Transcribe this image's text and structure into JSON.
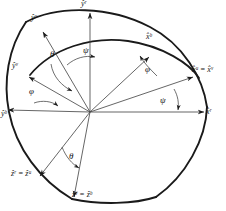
{
  "figure": {
    "type": "vector-frame-diagram",
    "origin": {
      "x": 90,
      "y": 112
    },
    "background_color": "#ffffff",
    "line_color": "#1a1a1a"
  },
  "axis_labels": [
    {
      "id": "y-r",
      "text": "ŷʳ",
      "base": "y",
      "sup": "r",
      "x": 82,
      "y": 1,
      "anchor": "top-center"
    },
    {
      "id": "y-u",
      "text": "ŷᵘ",
      "base": "y",
      "sup": "u",
      "x": 33,
      "y": 15,
      "anchor": "upper-left"
    },
    {
      "id": "y-v",
      "text": "ŷᵛ",
      "base": "y",
      "sup": "v",
      "x": 13,
      "y": 63,
      "anchor": "left"
    },
    {
      "id": "y-b",
      "text": "ŷᵇ",
      "base": "y",
      "sup": "b",
      "x": 2,
      "y": 110,
      "anchor": "lower-left"
    },
    {
      "id": "x-b",
      "text": "x̂ᵇ",
      "base": "x",
      "sup": "b",
      "x": 147,
      "y": 35,
      "anchor": "inner-arc"
    },
    {
      "id": "x-uv",
      "text": "x̂ᵘ = x̂ᵛ",
      "base": "x",
      "sup": "u = v",
      "x": 193,
      "y": 68,
      "anchor": "right"
    },
    {
      "id": "x-r",
      "text": "x̂ʳ",
      "base": "x",
      "sup": "r",
      "x": 205,
      "y": 110,
      "anchor": "far-right"
    },
    {
      "id": "z-ru",
      "text": "ẑʳ = ẑᵘ",
      "base": "z",
      "sup": "r = u",
      "x": 12,
      "y": 172,
      "anchor": "bottom-left"
    },
    {
      "id": "z-vb",
      "text": "ẑᵛ = ẑᵇ",
      "base": "z",
      "sup": "v = b",
      "x": 73,
      "y": 192,
      "anchor": "bottom-center"
    }
  ],
  "angle_labels": [
    {
      "id": "theta-upper",
      "text": "θ",
      "x": 51,
      "y": 54
    },
    {
      "id": "psi-upper",
      "text": "ψ",
      "x": 84,
      "y": 50
    },
    {
      "id": "phi-left",
      "text": "φ",
      "x": 30,
      "y": 91
    },
    {
      "id": "phi-right",
      "text": "φ",
      "x": 146,
      "y": 69
    },
    {
      "id": "psi-right",
      "text": "ψ",
      "x": 161,
      "y": 99
    },
    {
      "id": "theta-lower",
      "text": "θ",
      "x": 70,
      "y": 156
    }
  ],
  "arcs": [
    {
      "id": "outer-great-circle",
      "note": "outer ellipse arc from ŷᵘ region through ŷʳ to x̂ʳ and down to ẑᵛ"
    },
    {
      "id": "inner-great-circle",
      "note": "inner arc through x̂ᵇ from ŷᵛ to x̂ᵘ = x̂ᵛ"
    }
  ],
  "vectors": [
    {
      "id": "vec-x-r",
      "target": "x̂ʳ",
      "angle_deg": 0
    },
    {
      "id": "vec-x-uv",
      "target": "x̂ᵘ = x̂ᵛ",
      "angle_deg": 24
    },
    {
      "id": "vec-x-b",
      "target": "x̂ᵇ",
      "angle_deg": 47
    },
    {
      "id": "vec-y-r",
      "target": "ŷʳ",
      "angle_deg": 90
    },
    {
      "id": "vec-y-u",
      "target": "ŷᵘ",
      "angle_deg": 125
    },
    {
      "id": "vec-y-v",
      "target": "ŷᵛ",
      "angle_deg": 163
    },
    {
      "id": "vec-y-b",
      "target": "ŷᵇ",
      "angle_deg": 182
    },
    {
      "id": "vec-z-ru",
      "target": "ẑʳ = ẑᵘ",
      "angle_deg": 228
    },
    {
      "id": "vec-z-vb",
      "target": "ẑᵛ = ẑᵇ",
      "angle_deg": 260
    }
  ]
}
